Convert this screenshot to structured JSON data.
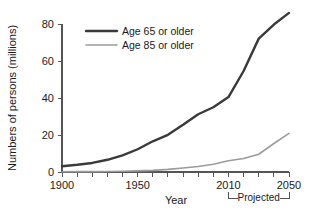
{
  "chart_data": {
    "type": "line",
    "title": "",
    "xlabel": "Year",
    "ylabel": "Numbers of persons (millions)",
    "xlim": [
      1900,
      2050
    ],
    "ylim": [
      0,
      80
    ],
    "grid": false,
    "legend_position": "top-left",
    "x_ticks_labeled": [
      "1900",
      "1950",
      "2010",
      "2050"
    ],
    "x_tick_values_labeled": [
      1900,
      1950,
      2010,
      2050
    ],
    "x_minor_tick_values": [
      1900,
      1910,
      1920,
      1930,
      1940,
      1950,
      1960,
      1970,
      1980,
      1990,
      2000,
      2010,
      2020,
      2030,
      2040,
      2050
    ],
    "y_ticks_labeled": [
      "0",
      "20",
      "40",
      "60",
      "80"
    ],
    "y_tick_values_labeled": [
      0,
      20,
      40,
      60,
      80
    ],
    "annotations": [
      {
        "text": "Projected",
        "span_start": 2010,
        "span_end": 2050
      }
    ],
    "series": [
      {
        "name": "Age 65 or older",
        "color": "#3a3a3a",
        "x": [
          1900,
          1910,
          1920,
          1930,
          1940,
          1950,
          1960,
          1970,
          1980,
          1990,
          2000,
          2010,
          2020,
          2030,
          2040,
          2050
        ],
        "values": [
          3.1,
          3.9,
          4.9,
          6.6,
          9.0,
          12.3,
          16.6,
          20.1,
          25.5,
          31.2,
          35.0,
          40.5,
          54.6,
          72.1,
          79.7,
          86.0
        ]
      },
      {
        "name": "Age 85 or older",
        "color": "#9b9b9b",
        "x": [
          1900,
          1910,
          1920,
          1930,
          1940,
          1950,
          1960,
          1970,
          1980,
          1990,
          2000,
          2010,
          2020,
          2030,
          2040,
          2050
        ],
        "values": [
          0.1,
          0.2,
          0.2,
          0.3,
          0.4,
          0.6,
          0.9,
          1.4,
          2.2,
          3.0,
          4.2,
          6.1,
          7.3,
          9.6,
          15.4,
          20.9
        ]
      }
    ]
  },
  "legend": {
    "entries": [
      {
        "label": "Age 65 or older"
      },
      {
        "label": "Age 85 or older"
      }
    ]
  },
  "axes": {
    "y_title": "Numbers of persons (millions)",
    "x_title": "Year"
  },
  "projection": {
    "label": "Projected"
  }
}
